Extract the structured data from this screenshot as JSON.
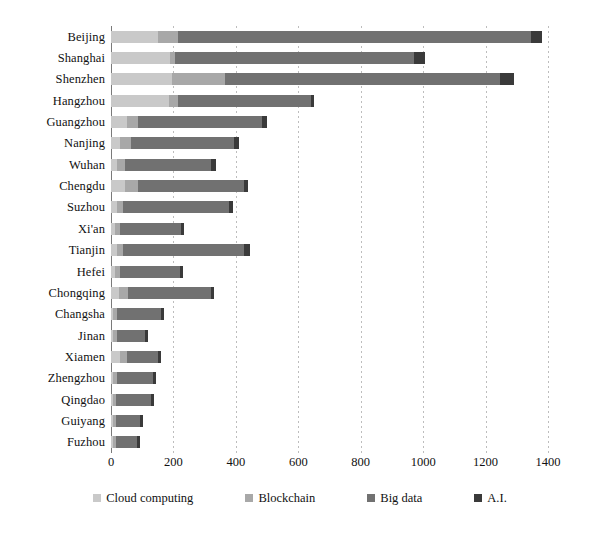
{
  "chart_data": {
    "type": "bar",
    "orientation": "horizontal",
    "stacked": true,
    "title": "",
    "subtitle": "",
    "xlabel": "",
    "ylabel": "",
    "xlim": [
      0,
      1400
    ],
    "xticks": [
      0,
      200,
      400,
      600,
      800,
      1000,
      1200,
      1400
    ],
    "grid": "vertical-dashed",
    "legend_position": "bottom",
    "categories": [
      "Beijing",
      "Shanghai",
      "Shenzhen",
      "Hangzhou",
      "Guangzhou",
      "Nanjing",
      "Wuhan",
      "Chengdu",
      "Suzhou",
      "Xi'an",
      "Tianjin",
      "Hefei",
      "Chongqing",
      "Changsha",
      "Jinan",
      "Xiamen",
      "Zhengzhou",
      "Qingdao",
      "Guiyang",
      "Fuzhou"
    ],
    "series": [
      {
        "name": "Cloud computing",
        "color": "#c9c9c9",
        "values": [
          150,
          190,
          195,
          185,
          50,
          30,
          20,
          45,
          18,
          12,
          20,
          12,
          25,
          8,
          8,
          30,
          8,
          6,
          6,
          6
        ]
      },
      {
        "name": "Blockchain",
        "color": "#a8a8a8",
        "values": [
          65,
          15,
          170,
          30,
          35,
          35,
          25,
          40,
          20,
          18,
          20,
          18,
          30,
          12,
          12,
          20,
          12,
          10,
          10,
          10
        ]
      },
      {
        "name": "Big data",
        "color": "#717171",
        "values": [
          1130,
          765,
          880,
          425,
          400,
          330,
          275,
          340,
          340,
          195,
          385,
          190,
          265,
          140,
          90,
          100,
          115,
          112,
          77,
          67
        ]
      },
      {
        "name": "A.I.",
        "color": "#3a3a3a",
        "values": [
          35,
          35,
          45,
          10,
          15,
          15,
          15,
          15,
          12,
          10,
          20,
          10,
          10,
          10,
          8,
          10,
          10,
          10,
          10,
          10
        ]
      }
    ],
    "totals": [
      1380,
      1005,
      1290,
      650,
      500,
      410,
      335,
      440,
      390,
      235,
      445,
      230,
      330,
      170,
      118,
      160,
      145,
      138,
      103,
      93
    ]
  },
  "axis": {
    "tick_labels": [
      "0",
      "200",
      "400",
      "600",
      "800",
      "1000",
      "1200",
      "1400"
    ]
  },
  "legend": {
    "items": [
      {
        "label": "Cloud computing",
        "color": "#c9c9c9"
      },
      {
        "label": "Blockchain",
        "color": "#a8a8a8"
      },
      {
        "label": "Big data",
        "color": "#717171"
      },
      {
        "label": "A.I.",
        "color": "#3a3a3a"
      }
    ]
  }
}
